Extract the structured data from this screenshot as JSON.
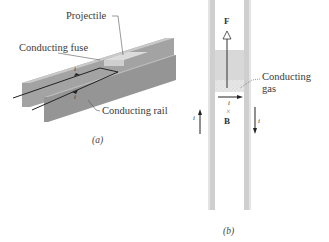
{
  "figure_a": {
    "caption": "(a)",
    "labels": {
      "projectile": "Projectile",
      "fuse": "Conducting fuse",
      "rail": "Conducting rail"
    },
    "current_symbol_top": "i",
    "current_symbol_bottom": "i"
  },
  "figure_b": {
    "caption": "(b)",
    "labels": {
      "gas_line1": "Conducting",
      "gas_line2": "gas"
    },
    "force_label": "F",
    "field_symbol": "×",
    "field_label": "B",
    "current_symbol_gas": "i",
    "current_symbol_left": "i",
    "current_symbol_right": "i"
  },
  "colors": {
    "rail_face": "#9a9a9a",
    "rail_top": "#c8c8c8",
    "projectile": "#d6d6d6",
    "gas": "#e2e2e2",
    "text": "#3a3a3a"
  }
}
